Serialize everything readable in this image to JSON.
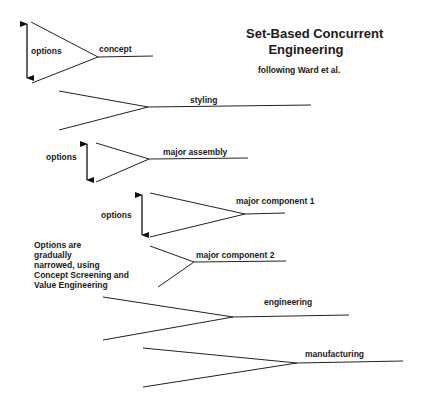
{
  "title": {
    "line1": "Set-Based Concurrent",
    "line2": "Engineering",
    "subtitle": "following Ward et al."
  },
  "note": {
    "line1": "Options are",
    "line2": "gradually",
    "line3": "narrowed, using",
    "line4": "Concept Screening and",
    "line5": "Value Engineering"
  },
  "stages": [
    {
      "label": "concept",
      "options_label": "options"
    },
    {
      "label": "styling"
    },
    {
      "label": "major assembly",
      "options_label": "options"
    },
    {
      "label": "major component 1",
      "options_label": "options"
    },
    {
      "label": "major component 2"
    },
    {
      "label": "engineering"
    },
    {
      "label": "manufacturing"
    }
  ],
  "colors": {
    "line": "#222222",
    "background": "#ffffff",
    "text": "#1a1a1a"
  }
}
